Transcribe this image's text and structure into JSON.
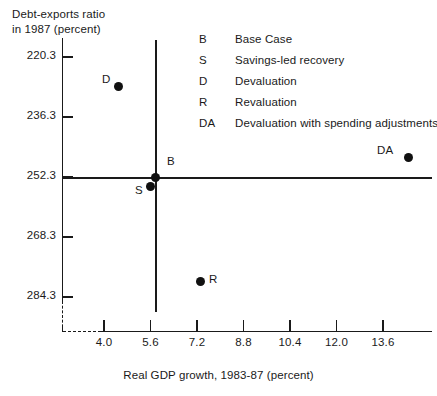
{
  "chart_data": {
    "type": "scatter",
    "title": "",
    "ylabel": "Debt-exports ratio in 1987 (percent)",
    "ylabel_line1": "Debt-exports ratio",
    "ylabel_line2": "in 1987 (percent)",
    "xlabel": "Real GDP growth, 1983-87 (percent)",
    "xticks": [
      "4.0",
      "5.6",
      "7.2",
      "8.8",
      "10.4",
      "12.0",
      "13.6"
    ],
    "xtick_values": [
      4.0,
      5.6,
      7.2,
      8.8,
      10.4,
      12.0,
      13.6
    ],
    "yticks": [
      "220.3",
      "236.3",
      "252.3",
      "268.3",
      "284.3"
    ],
    "ytick_values": [
      220.3,
      236.3,
      252.3,
      268.3,
      284.3
    ],
    "y_axis_inverted": true,
    "xlim": [
      3.2,
      14.9
    ],
    "ylim": [
      284.3,
      212.0
    ],
    "grid": false,
    "legend_position": "top-center",
    "axis_break": true,
    "reference_lines": {
      "vertical_x": 5.7,
      "horizontal_y": 252.3
    },
    "points": [
      {
        "key": "B",
        "label": "Base Case",
        "x": 5.75,
        "y": 252.3,
        "px": 155,
        "py": 177,
        "label_dx": 12,
        "label_dy": -15
      },
      {
        "key": "S",
        "label": "Savings-led recovery",
        "x": 5.6,
        "y": 254.8,
        "px": 150,
        "py": 186,
        "label_dx": -15,
        "label_dy": 5
      },
      {
        "key": "D",
        "label": "Devaluation",
        "x": 4.5,
        "y": 228.0,
        "px": 118,
        "py": 86,
        "label_dx": -16,
        "label_dy": -6
      },
      {
        "key": "R",
        "label": "Revaluation",
        "x": 7.3,
        "y": 280.0,
        "px": 200,
        "py": 281,
        "label_dx": 9,
        "label_dy": -1
      },
      {
        "key": "DA",
        "label": "Devaluation with spending adjustments",
        "x": 14.4,
        "y": 246.8,
        "px": 408,
        "py": 157,
        "label_dx": -31,
        "label_dy": -6
      }
    ]
  },
  "legend": {
    "items": [
      {
        "key": "B",
        "desc": "Base Case"
      },
      {
        "key": "S",
        "desc": "Savings-led recovery"
      },
      {
        "key": "D",
        "desc": "Devaluation"
      },
      {
        "key": "R",
        "desc": "Revaluation"
      },
      {
        "key": "DA",
        "desc": "Devaluation with spending adjustments"
      }
    ]
  }
}
